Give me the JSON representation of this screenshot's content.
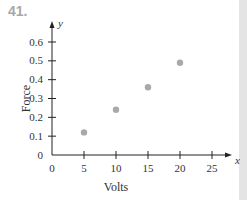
{
  "problem_number": "41.",
  "chart_data": {
    "type": "scatter",
    "title": "",
    "xlabel": "Volts",
    "ylabel": "Force",
    "x_axis_var": "x",
    "y_axis_var": "y",
    "x": [
      5,
      10,
      15,
      20
    ],
    "y": [
      0.12,
      0.24,
      0.36,
      0.49
    ],
    "xlim": [
      0,
      27
    ],
    "ylim": [
      0,
      0.66
    ],
    "x_ticks": [
      0,
      5,
      10,
      15,
      20,
      25
    ],
    "x_tick_labels": [
      "0",
      "5",
      "10",
      "15",
      "20",
      "25"
    ],
    "y_ticks": [
      0,
      0.1,
      0.2,
      0.3,
      0.4,
      0.5,
      0.6
    ],
    "y_tick_labels": [
      "0",
      "0.1",
      "0.2",
      "0.3",
      "0.4",
      "0.5",
      "0.6"
    ],
    "grid": false,
    "legend": null,
    "point_color": "#a9a9a9"
  }
}
